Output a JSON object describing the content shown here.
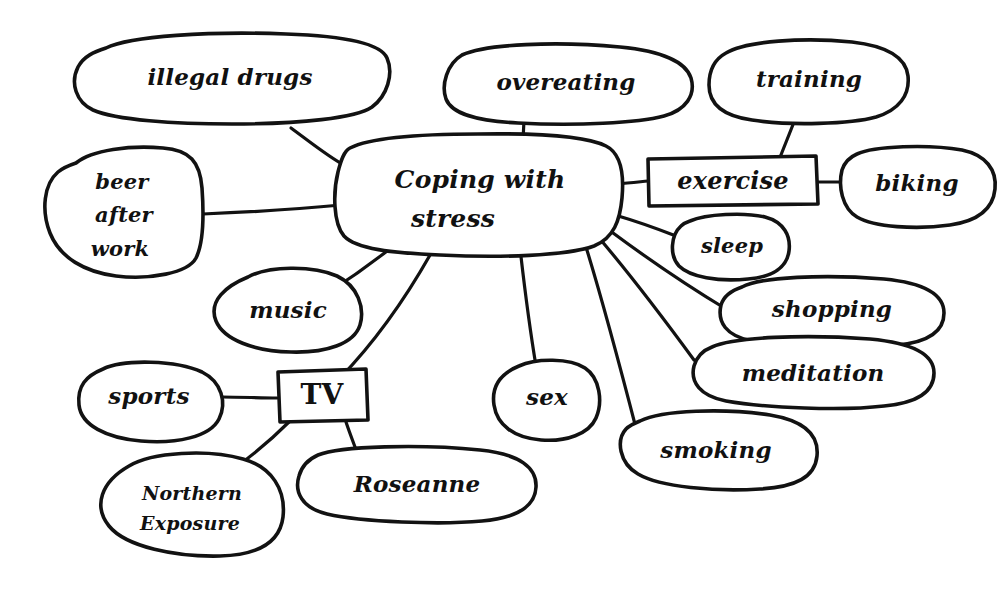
{
  "diagram": {
    "kind": "hand-drawn-mind-map",
    "medium": "ink on white paper",
    "ink_color": "#121212",
    "background_color": "#ffffff",
    "central_topic": {
      "id": "coping-with-stress",
      "label_line1": "Coping with",
      "label_line2": "stress",
      "label": "Coping with stress",
      "shape": "rounded-ellipse"
    },
    "nodes": [
      {
        "id": "illegal-drugs",
        "label": "illegal drugs",
        "shape": "ellipse",
        "parent": "coping-with-stress"
      },
      {
        "id": "beer-after-work",
        "label": "beer after work",
        "line1": "beer",
        "line2": "after",
        "line3": "work",
        "shape": "ellipse",
        "parent": "coping-with-stress"
      },
      {
        "id": "overeating",
        "label": "overeating",
        "shape": "ellipse",
        "parent": "coping-with-stress"
      },
      {
        "id": "training",
        "label": "training",
        "shape": "ellipse",
        "parent": "exercise"
      },
      {
        "id": "exercise",
        "label": "exercise",
        "shape": "rectangle",
        "parent": "coping-with-stress"
      },
      {
        "id": "biking",
        "label": "biking",
        "shape": "ellipse",
        "parent": "exercise"
      },
      {
        "id": "sleep",
        "label": "sleep",
        "shape": "ellipse",
        "parent": "coping-with-stress"
      },
      {
        "id": "shopping",
        "label": "shopping",
        "shape": "ellipse",
        "parent": "coping-with-stress"
      },
      {
        "id": "meditation",
        "label": "meditation",
        "shape": "ellipse",
        "parent": "coping-with-stress"
      },
      {
        "id": "smoking",
        "label": "smoking",
        "shape": "ellipse",
        "parent": "coping-with-stress"
      },
      {
        "id": "sex",
        "label": "sex",
        "shape": "ellipse",
        "parent": "coping-with-stress"
      },
      {
        "id": "music",
        "label": "music",
        "shape": "ellipse",
        "parent": "coping-with-stress"
      },
      {
        "id": "tv",
        "label": "TV",
        "shape": "rectangle",
        "parent": "coping-with-stress"
      },
      {
        "id": "sports",
        "label": "sports",
        "shape": "ellipse",
        "parent": "tv"
      },
      {
        "id": "northern-exposure",
        "label": "Northern Exposure",
        "line1": "Northern",
        "line2": "Exposure",
        "shape": "ellipse",
        "parent": "tv"
      },
      {
        "id": "roseanne",
        "label": "Roseanne",
        "shape": "ellipse",
        "parent": "tv"
      }
    ],
    "edges": [
      {
        "from": "coping-with-stress",
        "to": "illegal-drugs"
      },
      {
        "from": "coping-with-stress",
        "to": "beer-after-work"
      },
      {
        "from": "coping-with-stress",
        "to": "overeating"
      },
      {
        "from": "coping-with-stress",
        "to": "exercise"
      },
      {
        "from": "exercise",
        "to": "training"
      },
      {
        "from": "exercise",
        "to": "biking"
      },
      {
        "from": "coping-with-stress",
        "to": "sleep"
      },
      {
        "from": "coping-with-stress",
        "to": "shopping"
      },
      {
        "from": "coping-with-stress",
        "to": "meditation"
      },
      {
        "from": "coping-with-stress",
        "to": "smoking"
      },
      {
        "from": "coping-with-stress",
        "to": "sex"
      },
      {
        "from": "coping-with-stress",
        "to": "music"
      },
      {
        "from": "coping-with-stress",
        "to": "tv"
      },
      {
        "from": "tv",
        "to": "sports"
      },
      {
        "from": "tv",
        "to": "northern-exposure"
      },
      {
        "from": "tv",
        "to": "roseanne"
      }
    ]
  }
}
